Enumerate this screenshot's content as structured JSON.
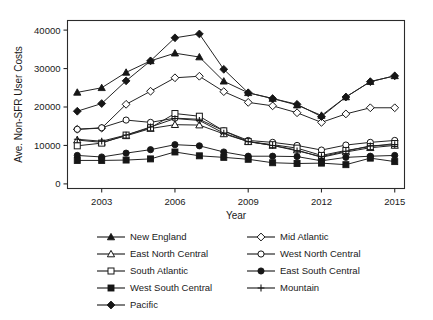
{
  "chart_data": {
    "type": "line",
    "title": "",
    "xlabel": "Year",
    "ylabel": "Ave. Non-SFR User Costs",
    "x": [
      2002,
      2003,
      2004,
      2005,
      2006,
      2007,
      2008,
      2009,
      2010,
      2011,
      2012,
      2013,
      2014,
      2015
    ],
    "xlim": [
      2001.6,
      2015.4
    ],
    "ylim": [
      -1200,
      42500
    ],
    "xticks": [
      2003,
      2006,
      2009,
      2012,
      2015
    ],
    "xticklabels": [
      "2003",
      "2006",
      "2009",
      "2012",
      "2015"
    ],
    "yticks": [
      0,
      10000,
      20000,
      30000,
      40000
    ],
    "yticklabels": [
      "0",
      "10000",
      "20000",
      "30000",
      "40000"
    ],
    "grid": false,
    "legend_position": "below-plot",
    "series": [
      {
        "name": "New England",
        "marker": "filled-triangle",
        "values": [
          23800,
          25000,
          29000,
          32000,
          34000,
          33000,
          26700,
          23700,
          22200,
          20500,
          17800,
          22600,
          26600,
          28100
        ]
      },
      {
        "name": "Mid Atlantic",
        "marker": "open-diamond",
        "values": [
          14200,
          14500,
          20700,
          24100,
          27600,
          28000,
          24000,
          21200,
          20300,
          18500,
          16000,
          18200,
          19800,
          19800
        ]
      },
      {
        "name": "East North Central",
        "marker": "open-triangle",
        "values": [
          11400,
          10800,
          12500,
          14400,
          15400,
          15300,
          13000,
          11000,
          10000,
          8800,
          6900,
          8300,
          9400,
          10000
        ]
      },
      {
        "name": "West North Central",
        "marker": "open-circle",
        "values": [
          14200,
          14600,
          16600,
          16000,
          17100,
          16800,
          13800,
          11300,
          10800,
          10000,
          8800,
          10100,
          10800,
          11300
        ]
      },
      {
        "name": "South Atlantic",
        "marker": "open-square",
        "values": [
          9900,
          10600,
          12700,
          14600,
          18300,
          17600,
          13800,
          11000,
          10200,
          9300,
          7400,
          8700,
          9700,
          10500
        ]
      },
      {
        "name": "East South Central",
        "marker": "filled-circle",
        "values": [
          7400,
          7000,
          8000,
          8900,
          10200,
          9900,
          8300,
          7200,
          7200,
          7100,
          6000,
          6900,
          7200,
          7400
        ]
      },
      {
        "name": "West South Central",
        "marker": "filled-square",
        "values": [
          6100,
          6100,
          6200,
          6500,
          8300,
          7300,
          6900,
          6400,
          5500,
          5300,
          5400,
          5000,
          6700,
          5800
        ]
      },
      {
        "name": "Mountain",
        "marker": "plus",
        "values": [
          11600,
          11100,
          12700,
          14800,
          17000,
          16500,
          13200,
          11000,
          10000,
          8600,
          7100,
          8500,
          9900,
          10200
        ]
      },
      {
        "name": "Pacific",
        "marker": "filled-diamond",
        "values": [
          18900,
          20900,
          26800,
          32000,
          38000,
          39000,
          29800,
          23700,
          22200,
          20700,
          17500,
          22600,
          26600,
          28100
        ]
      }
    ]
  },
  "legend": {
    "items": [
      {
        "label": "New England",
        "marker": "filled-triangle"
      },
      {
        "label": "Mid Atlantic",
        "marker": "open-diamond"
      },
      {
        "label": "East North Central",
        "marker": "open-triangle"
      },
      {
        "label": "West North Central",
        "marker": "open-circle"
      },
      {
        "label": "South Atlantic",
        "marker": "open-square"
      },
      {
        "label": "East South Central",
        "marker": "filled-circle"
      },
      {
        "label": "West South Central",
        "marker": "filled-square"
      },
      {
        "label": "Mountain",
        "marker": "plus"
      },
      {
        "label": "Pacific",
        "marker": "filled-diamond"
      }
    ]
  },
  "colors": {
    "ink": "#161616",
    "axis": "#2b2b2b",
    "background": "#ffffff"
  }
}
